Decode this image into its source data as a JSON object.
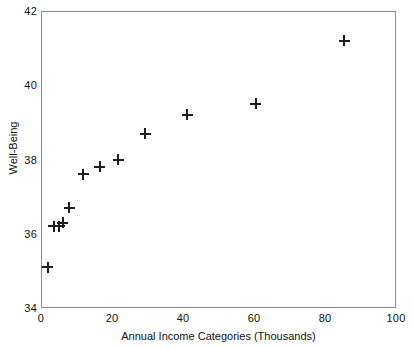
{
  "chart_data": {
    "type": "scatter",
    "title": "",
    "xlabel": "Annual Income Categories (Thousands)",
    "ylabel": "Well-Being",
    "xlim": [
      0,
      100
    ],
    "ylim": [
      34,
      42
    ],
    "xticks": [
      "0",
      "20",
      "40",
      "60",
      "80",
      "100"
    ],
    "yticks": [
      "34",
      "36",
      "38",
      "40",
      "42"
    ],
    "grid": false,
    "legend": null,
    "marker": "plus",
    "marker_color": "#1d1d1d",
    "frame_color": "#8e8e8e",
    "points": [
      {
        "x": 1.9,
        "y": 35.1
      },
      {
        "x": 3.6,
        "y": 36.2
      },
      {
        "x": 5.2,
        "y": 36.2
      },
      {
        "x": 6.1,
        "y": 36.3
      },
      {
        "x": 8.0,
        "y": 36.7
      },
      {
        "x": 11.9,
        "y": 37.6
      },
      {
        "x": 16.6,
        "y": 37.8
      },
      {
        "x": 21.8,
        "y": 38.0
      },
      {
        "x": 29.3,
        "y": 38.7
      },
      {
        "x": 41.2,
        "y": 39.2
      },
      {
        "x": 60.5,
        "y": 39.5
      },
      {
        "x": 85.4,
        "y": 41.2
      }
    ]
  }
}
